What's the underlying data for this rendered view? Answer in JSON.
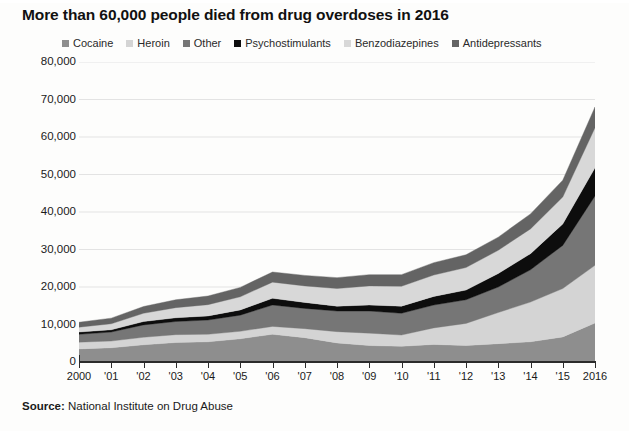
{
  "title": "More than 60,000 people died from drug overdoses in 2016",
  "source": {
    "label": "Source:",
    "text": " National Institute on Drug Abuse"
  },
  "chart_data": {
    "type": "area",
    "stacked": true,
    "title": "More than 60,000 people died from drug overdoses in 2016",
    "xlabel": "",
    "ylabel": "",
    "ylim": [
      0,
      80000
    ],
    "ytick_values": [
      0,
      10000,
      20000,
      30000,
      40000,
      50000,
      60000,
      70000,
      80000
    ],
    "ytick_labels": [
      "0",
      "10,000",
      "20,000",
      "30,000",
      "40,000",
      "50,000",
      "60,000",
      "70,000",
      "80,000"
    ],
    "grid": true,
    "legend_position": "top",
    "x": [
      2000,
      2001,
      2002,
      2003,
      2004,
      2005,
      2006,
      2007,
      2008,
      2009,
      2010,
      2011,
      2012,
      2013,
      2014,
      2015,
      2016
    ],
    "xtick_labels": [
      "2000",
      "'01",
      "'02",
      "'03",
      "'04",
      "'05",
      "'06",
      "'07",
      "'08",
      "'09",
      "'10",
      "'11",
      "'12",
      "'13",
      "'14",
      "'15",
      "2016"
    ],
    "series": [
      {
        "name": "Cocaine",
        "color": "#8e8e8e",
        "values": [
          3500,
          3800,
          4600,
          5200,
          5400,
          6200,
          7400,
          6500,
          5100,
          4400,
          4200,
          4700,
          4400,
          4900,
          5400,
          6700,
          10400
        ]
      },
      {
        "name": "Heroin",
        "color": "#d4d4d4",
        "values": [
          1800,
          1800,
          2000,
          2100,
          2000,
          2000,
          2100,
          2400,
          3000,
          3300,
          3000,
          4400,
          5900,
          8300,
          10600,
          12900,
          15400
        ]
      },
      {
        "name": "Other",
        "color": "#767676",
        "values": [
          2100,
          2400,
          3300,
          3500,
          3800,
          4300,
          5700,
          5400,
          5500,
          5900,
          5800,
          6100,
          6300,
          6800,
          8600,
          11500,
          18500
        ]
      },
      {
        "name": "Psychostimulants",
        "color": "#0d0d0d",
        "values": [
          600,
          600,
          900,
          1000,
          1100,
          1400,
          1800,
          1600,
          1300,
          1600,
          1900,
          2300,
          2600,
          3600,
          4300,
          5700,
          7500
        ]
      },
      {
        "name": "Benzodiazepines",
        "color": "#d8d8d8",
        "values": [
          1300,
          1600,
          2200,
          2700,
          3000,
          3500,
          4300,
          4400,
          4700,
          5100,
          5300,
          5700,
          6000,
          6200,
          6600,
          7200,
          10700
        ]
      },
      {
        "name": "Antidepressants",
        "color": "#646464",
        "values": [
          1300,
          1500,
          1800,
          2100,
          2300,
          2500,
          2700,
          2800,
          2900,
          3000,
          3100,
          3300,
          3400,
          3500,
          4000,
          4500,
          5500
        ]
      }
    ],
    "totals": [
      10600,
      11700,
      14800,
      16600,
      17600,
      19900,
      24000,
      23100,
      22500,
      23300,
      23300,
      26500,
      28600,
      33300,
      39500,
      48500,
      68000
    ],
    "annotations": []
  }
}
